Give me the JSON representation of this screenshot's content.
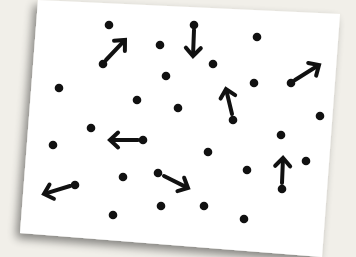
{
  "scene": {
    "description": "White card with scattered black dots; some dots have arrows indicating direction of motion",
    "background_color": "#f1efe9",
    "card_color": "#ffffff",
    "ink_color": "#111111",
    "card_corners": [
      [
        38,
        0
      ],
      [
        340,
        14
      ],
      [
        322,
        257
      ],
      [
        20,
        233
      ]
    ]
  },
  "dots": [
    [
      109,
      25
    ],
    [
      194,
      25
    ],
    [
      257,
      37
    ],
    [
      160,
      45
    ],
    [
      103,
      64
    ],
    [
      213,
      64
    ],
    [
      166,
      76
    ],
    [
      59,
      88
    ],
    [
      254,
      83
    ],
    [
      291,
      83
    ],
    [
      137,
      100
    ],
    [
      178,
      108
    ],
    [
      320,
      116
    ],
    [
      91,
      128
    ],
    [
      233,
      120
    ],
    [
      143,
      140
    ],
    [
      281,
      135
    ],
    [
      53,
      145
    ],
    [
      208,
      152
    ],
    [
      306,
      161
    ],
    [
      123,
      177
    ],
    [
      158,
      173
    ],
    [
      247,
      170
    ],
    [
      75,
      185
    ],
    [
      282,
      189
    ],
    [
      161,
      206
    ],
    [
      204,
      206
    ],
    [
      113,
      215
    ],
    [
      244,
      219
    ]
  ],
  "arrows": [
    {
      "direction": "up-right",
      "from": [
        106,
        60
      ],
      "to": [
        125,
        40
      ]
    },
    {
      "direction": "down",
      "from": [
        194,
        30
      ],
      "to": [
        193,
        56
      ]
    },
    {
      "direction": "up-right",
      "from": [
        295,
        80
      ],
      "to": [
        319,
        65
      ]
    },
    {
      "direction": "up",
      "from": [
        232,
        114
      ],
      "to": [
        226,
        89
      ]
    },
    {
      "direction": "left",
      "from": [
        138,
        140
      ],
      "to": [
        110,
        140
      ]
    },
    {
      "direction": "left",
      "from": [
        70,
        186
      ],
      "to": [
        44,
        194
      ]
    },
    {
      "direction": "down-right",
      "from": [
        164,
        176
      ],
      "to": [
        188,
        188
      ]
    },
    {
      "direction": "up",
      "from": [
        282,
        183
      ],
      "to": [
        283,
        158
      ]
    }
  ]
}
